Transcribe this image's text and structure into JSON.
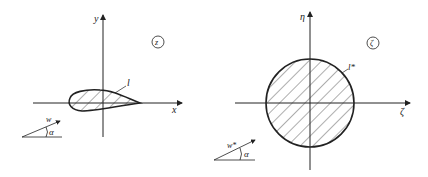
{
  "diagram": {
    "left_panel": {
      "plane_label": "z",
      "axis_x_label": "x",
      "axis_y_label": "y",
      "contour_label": "l",
      "flow_velocity_label": "w",
      "angle_label": "α",
      "shape": "airfoil"
    },
    "right_panel": {
      "plane_label": "ζ",
      "axis_x_label": "ζ",
      "axis_y_label": "η",
      "contour_label": "l*",
      "flow_velocity_label": "w*",
      "angle_label": "α",
      "shape": "circle"
    },
    "colors": {
      "stroke": "#222222",
      "background": "#ffffff"
    }
  }
}
